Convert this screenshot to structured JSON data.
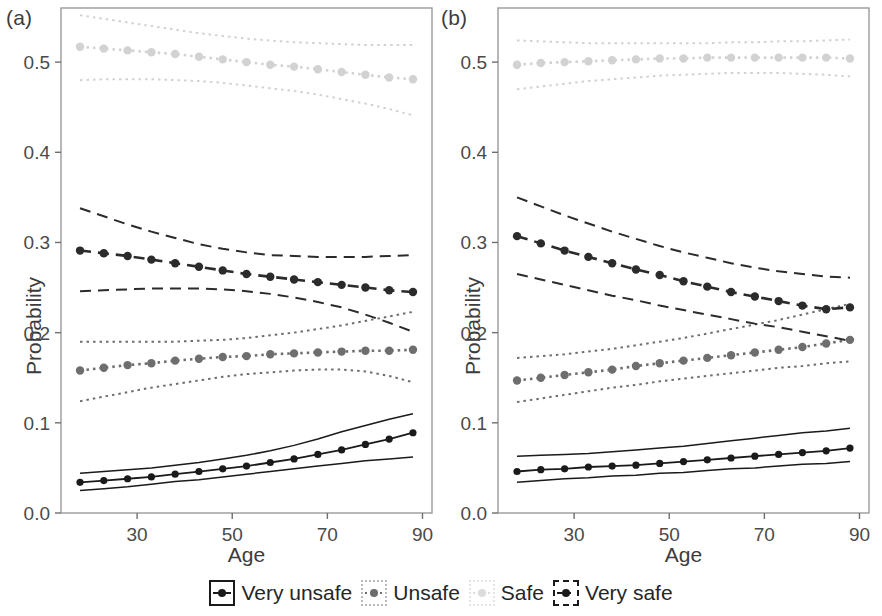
{
  "figure": {
    "panels": [
      {
        "label": "(a)",
        "xlabel": "Age",
        "ylabel": "Probability"
      },
      {
        "label": "(b)",
        "xlabel": "Age",
        "ylabel": "Probability"
      }
    ]
  },
  "legend": {
    "items": [
      {
        "label": "Very unsafe",
        "key": "solid-box-key",
        "line_style": "solid",
        "color": "#1a1a1a"
      },
      {
        "label": "Unsafe",
        "key": "dotted-box-key",
        "line_style": "dotted",
        "color": "#6e6e6e"
      },
      {
        "label": "Safe",
        "key": "faint-box-key",
        "line_style": "dotted",
        "color": "#dcdcdc"
      },
      {
        "label": "Very safe",
        "key": "dashed-box-key",
        "line_style": "dashed",
        "color": "#1a1a1a"
      }
    ]
  },
  "chart_data": [
    {
      "type": "line",
      "panel": "(a)",
      "title": "",
      "xlabel": "Age",
      "ylabel": "Probability",
      "xlim": [
        14,
        92
      ],
      "ylim": [
        0.0,
        0.56
      ],
      "xticks": [
        30,
        50,
        70,
        90
      ],
      "yticks": [
        0.0,
        0.1,
        0.2,
        0.3,
        0.4,
        0.5
      ],
      "ytick_labels": [
        "0.0",
        "0.1",
        "0.2",
        "0.3",
        "0.4",
        "0.5"
      ],
      "xtick_labels": [
        "30",
        "50",
        "70",
        "90"
      ],
      "grid": false,
      "legend_position": "bottom",
      "x": [
        18,
        23,
        28,
        33,
        38,
        43,
        48,
        53,
        58,
        63,
        68,
        73,
        78,
        83,
        88
      ],
      "series": [
        {
          "name": "Very unsafe",
          "line_style": "solid",
          "color": "#1a1a1a",
          "values": [
            0.034,
            0.036,
            0.038,
            0.04,
            0.043,
            0.046,
            0.049,
            0.052,
            0.056,
            0.06,
            0.065,
            0.07,
            0.076,
            0.082,
            0.089
          ],
          "ci_upper": [
            0.044,
            0.046,
            0.048,
            0.05,
            0.053,
            0.056,
            0.06,
            0.064,
            0.069,
            0.075,
            0.082,
            0.09,
            0.097,
            0.104,
            0.11
          ],
          "ci_lower": [
            0.025,
            0.027,
            0.029,
            0.032,
            0.035,
            0.037,
            0.04,
            0.043,
            0.046,
            0.049,
            0.052,
            0.055,
            0.058,
            0.06,
            0.062
          ]
        },
        {
          "name": "Unsafe",
          "line_style": "dotted",
          "color": "#6e6e6e",
          "values": [
            0.158,
            0.161,
            0.164,
            0.166,
            0.169,
            0.171,
            0.173,
            0.174,
            0.176,
            0.177,
            0.178,
            0.179,
            0.18,
            0.18,
            0.181
          ],
          "ci_upper": [
            0.19,
            0.19,
            0.19,
            0.19,
            0.19,
            0.191,
            0.192,
            0.194,
            0.197,
            0.2,
            0.204,
            0.208,
            0.213,
            0.218,
            0.223
          ],
          "ci_lower": [
            0.124,
            0.129,
            0.134,
            0.139,
            0.143,
            0.147,
            0.151,
            0.154,
            0.156,
            0.158,
            0.159,
            0.159,
            0.157,
            0.152,
            0.145
          ]
        },
        {
          "name": "Safe",
          "line_style": "dotted",
          "color": "#d2d2d2",
          "values": [
            0.517,
            0.515,
            0.513,
            0.511,
            0.509,
            0.506,
            0.503,
            0.5,
            0.497,
            0.495,
            0.492,
            0.489,
            0.486,
            0.483,
            0.481
          ],
          "ci_upper": [
            0.552,
            0.548,
            0.544,
            0.54,
            0.536,
            0.532,
            0.529,
            0.526,
            0.524,
            0.522,
            0.521,
            0.52,
            0.519,
            0.519,
            0.519
          ],
          "ci_lower": [
            0.48,
            0.481,
            0.481,
            0.481,
            0.48,
            0.479,
            0.477,
            0.474,
            0.471,
            0.468,
            0.464,
            0.459,
            0.454,
            0.448,
            0.441
          ]
        },
        {
          "name": "Very safe",
          "line_style": "dashed",
          "color": "#2b2b2b",
          "values": [
            0.291,
            0.288,
            0.285,
            0.281,
            0.277,
            0.273,
            0.269,
            0.265,
            0.262,
            0.259,
            0.256,
            0.253,
            0.25,
            0.247,
            0.245
          ],
          "ci_upper": [
            0.338,
            0.329,
            0.32,
            0.312,
            0.305,
            0.298,
            0.293,
            0.289,
            0.286,
            0.285,
            0.284,
            0.284,
            0.284,
            0.285,
            0.286
          ],
          "ci_lower": [
            0.246,
            0.247,
            0.248,
            0.249,
            0.249,
            0.249,
            0.248,
            0.246,
            0.243,
            0.239,
            0.234,
            0.228,
            0.22,
            0.211,
            0.201
          ]
        }
      ]
    },
    {
      "type": "line",
      "panel": "(b)",
      "title": "",
      "xlabel": "Age",
      "ylabel": "Probability",
      "xlim": [
        14,
        92
      ],
      "ylim": [
        0.0,
        0.56
      ],
      "xticks": [
        30,
        50,
        70,
        90
      ],
      "yticks": [
        0.0,
        0.1,
        0.2,
        0.3,
        0.4,
        0.5
      ],
      "ytick_labels": [
        "0.0",
        "0.1",
        "0.2",
        "0.3",
        "0.4",
        "0.5"
      ],
      "xtick_labels": [
        "30",
        "50",
        "70",
        "90"
      ],
      "grid": false,
      "legend_position": "bottom",
      "x": [
        18,
        23,
        28,
        33,
        38,
        43,
        48,
        53,
        58,
        63,
        68,
        73,
        78,
        83,
        88
      ],
      "series": [
        {
          "name": "Very unsafe",
          "line_style": "solid",
          "color": "#1a1a1a",
          "values": [
            0.046,
            0.048,
            0.049,
            0.051,
            0.052,
            0.053,
            0.055,
            0.057,
            0.059,
            0.061,
            0.063,
            0.065,
            0.067,
            0.069,
            0.072
          ],
          "ci_upper": [
            0.063,
            0.064,
            0.065,
            0.066,
            0.068,
            0.07,
            0.072,
            0.074,
            0.077,
            0.08,
            0.083,
            0.086,
            0.089,
            0.091,
            0.094
          ],
          "ci_lower": [
            0.034,
            0.036,
            0.038,
            0.039,
            0.041,
            0.042,
            0.044,
            0.045,
            0.047,
            0.049,
            0.05,
            0.052,
            0.054,
            0.055,
            0.057
          ]
        },
        {
          "name": "Unsafe",
          "line_style": "dotted",
          "color": "#6e6e6e",
          "values": [
            0.147,
            0.15,
            0.153,
            0.156,
            0.159,
            0.163,
            0.166,
            0.169,
            0.172,
            0.175,
            0.178,
            0.181,
            0.184,
            0.188,
            0.192
          ],
          "ci_upper": [
            0.172,
            0.174,
            0.176,
            0.179,
            0.182,
            0.186,
            0.19,
            0.194,
            0.199,
            0.204,
            0.209,
            0.214,
            0.22,
            0.226,
            0.232
          ],
          "ci_lower": [
            0.123,
            0.127,
            0.131,
            0.135,
            0.139,
            0.142,
            0.146,
            0.149,
            0.152,
            0.155,
            0.158,
            0.161,
            0.163,
            0.166,
            0.168
          ]
        },
        {
          "name": "Safe",
          "line_style": "dotted",
          "color": "#d2d2d2",
          "values": [
            0.497,
            0.499,
            0.5,
            0.501,
            0.502,
            0.503,
            0.504,
            0.504,
            0.505,
            0.505,
            0.505,
            0.505,
            0.505,
            0.505,
            0.504
          ],
          "ci_upper": [
            0.524,
            0.523,
            0.522,
            0.521,
            0.521,
            0.521,
            0.521,
            0.521,
            0.521,
            0.522,
            0.522,
            0.523,
            0.523,
            0.524,
            0.525
          ],
          "ci_lower": [
            0.47,
            0.473,
            0.476,
            0.479,
            0.481,
            0.483,
            0.485,
            0.486,
            0.487,
            0.488,
            0.488,
            0.488,
            0.487,
            0.486,
            0.484
          ]
        },
        {
          "name": "Very safe",
          "line_style": "dashed",
          "color": "#2b2b2b",
          "values": [
            0.307,
            0.299,
            0.291,
            0.284,
            0.277,
            0.27,
            0.264,
            0.257,
            0.251,
            0.245,
            0.24,
            0.235,
            0.23,
            0.226,
            0.228
          ],
          "ci_upper": [
            0.35,
            0.34,
            0.33,
            0.321,
            0.312,
            0.304,
            0.296,
            0.289,
            0.283,
            0.277,
            0.272,
            0.268,
            0.265,
            0.262,
            0.261
          ],
          "ci_lower": [
            0.265,
            0.259,
            0.253,
            0.247,
            0.241,
            0.236,
            0.23,
            0.225,
            0.22,
            0.215,
            0.21,
            0.206,
            0.201,
            0.196,
            0.191
          ]
        }
      ]
    }
  ]
}
